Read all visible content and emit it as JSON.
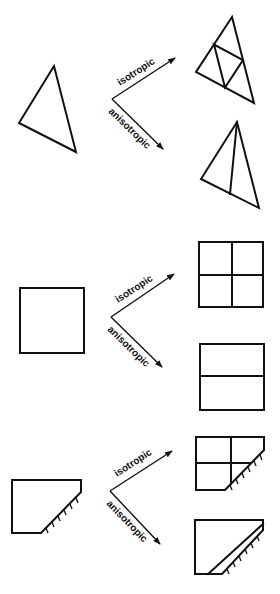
{
  "diagram": {
    "rows": [
      {
        "name": "triangle",
        "original": "triangle",
        "isotropic_label": "isotropic",
        "anisotropic_label": "anisotropic",
        "isotropic_result": "triangle subdivided into 4 sub-triangles via edge midpoints",
        "anisotropic_result": "triangle bisected by a line from apex to opposite edge"
      },
      {
        "name": "square",
        "original": "square",
        "isotropic_label": "isotropic",
        "anisotropic_label": "anisotropic",
        "isotropic_result": "square subdivided into 4 quadrants",
        "anisotropic_result": "square split into 2 horizontal halves"
      },
      {
        "name": "boundary-element",
        "original": "pentagon with hatched boundary edge",
        "isotropic_label": "isotropic",
        "anisotropic_label": "anisotropic",
        "isotropic_result": "element subdivided into 4 cells",
        "anisotropic_result": "thin layer split off parallel to hatched boundary"
      }
    ],
    "colors": {
      "line": "#111111",
      "background": "#ffffff"
    }
  }
}
